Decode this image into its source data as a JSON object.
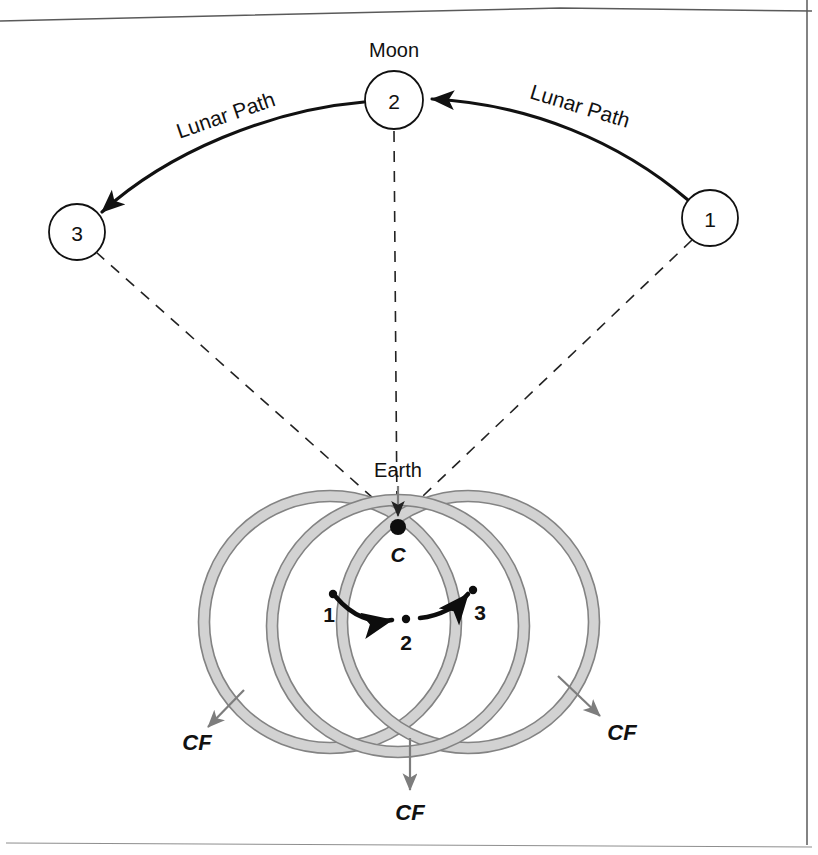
{
  "figure": {
    "type": "diagram",
    "background_color": "#ffffff",
    "line_color": "#111111",
    "ring_fill_color": "#d2d2d2",
    "ring_edge_color": "#838383",
    "cf_arrow_color": "#7d7d7d"
  },
  "moon": {
    "title": "Moon",
    "nodes": [
      {
        "label": "1",
        "cx": 710,
        "cy": 218,
        "r": 28
      },
      {
        "label": "2",
        "cx": 394,
        "cy": 100,
        "r": 29
      },
      {
        "label": "3",
        "cx": 77,
        "cy": 232,
        "r": 28
      }
    ],
    "path_labels": [
      {
        "text": "Lunar Path",
        "x": 228,
        "y": 122,
        "rotate": -19
      },
      {
        "text": "Lunar Path",
        "x": 578,
        "y": 113,
        "rotate": 17
      }
    ],
    "arrow_direction": "right-to-left (from 1 through 2 to 3)"
  },
  "earth": {
    "title": "Earth",
    "center_label": "C",
    "center_point": {
      "x": 398,
      "y": 527
    },
    "convergence_point": {
      "x": 398,
      "y": 500
    },
    "rings": [
      {
        "name": "left-ring",
        "cx": 330,
        "cy": 622,
        "r": 126
      },
      {
        "name": "middle-ring",
        "cx": 398,
        "cy": 626,
        "r": 126
      },
      {
        "name": "right-ring",
        "cx": 468,
        "cy": 622,
        "r": 126
      }
    ],
    "motion_points": [
      {
        "label": "1",
        "x": 333,
        "y": 594,
        "label_x": 329,
        "label_y": 622
      },
      {
        "label": "2",
        "x": 406,
        "y": 619,
        "label_x": 406,
        "label_y": 649
      },
      {
        "label": "3",
        "x": 473,
        "y": 590,
        "label_x": 479,
        "label_y": 620
      }
    ],
    "cf_labels": [
      {
        "text": "CF",
        "x": 197,
        "y": 748
      },
      {
        "text": "CF",
        "x": 410,
        "y": 818
      },
      {
        "text": "CF",
        "x": 622,
        "y": 738
      }
    ]
  }
}
